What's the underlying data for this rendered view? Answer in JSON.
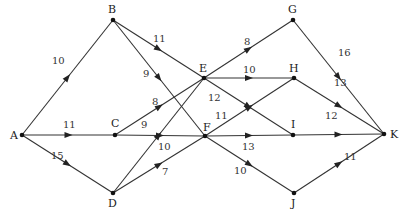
{
  "diagram": {
    "type": "directed-weighted-network",
    "nodes": [
      {
        "id": "A",
        "label": "A",
        "x": 22,
        "y": 135,
        "lx": 10,
        "ly": 139
      },
      {
        "id": "B",
        "label": "B",
        "x": 113,
        "y": 20,
        "lx": 108,
        "ly": 13
      },
      {
        "id": "C",
        "label": "C",
        "x": 115,
        "y": 135,
        "lx": 111,
        "ly": 127
      },
      {
        "id": "D",
        "label": "D",
        "x": 113,
        "y": 193,
        "lx": 108,
        "ly": 207
      },
      {
        "id": "E",
        "label": "E",
        "x": 204,
        "y": 78,
        "lx": 199,
        "ly": 72
      },
      {
        "id": "F",
        "label": "F",
        "x": 205,
        "y": 136,
        "lx": 203,
        "ly": 131
      },
      {
        "id": "G",
        "label": "G",
        "x": 293,
        "y": 20,
        "lx": 288,
        "ly": 13
      },
      {
        "id": "H",
        "label": "H",
        "x": 294,
        "y": 78,
        "lx": 289,
        "ly": 72
      },
      {
        "id": "I",
        "label": "I",
        "x": 293,
        "y": 135,
        "lx": 291,
        "ly": 128
      },
      {
        "id": "J",
        "label": "J",
        "x": 294,
        "y": 193,
        "lx": 291,
        "ly": 207
      },
      {
        "id": "K",
        "label": "K",
        "x": 384,
        "y": 134,
        "lx": 390,
        "ly": 138
      }
    ],
    "edges": [
      {
        "from": "A",
        "to": "B",
        "weight": "10",
        "lx": 52,
        "ly": 64
      },
      {
        "from": "A",
        "to": "C",
        "weight": "11",
        "lx": 63,
        "ly": 128
      },
      {
        "from": "A",
        "to": "D",
        "weight": "15",
        "lx": 51,
        "ly": 159
      },
      {
        "from": "B",
        "to": "E",
        "weight": "11",
        "lx": 153,
        "ly": 42
      },
      {
        "from": "B",
        "to": "F",
        "weight": "9",
        "lx": 143,
        "ly": 77
      },
      {
        "from": "C",
        "to": "E",
        "weight": "8",
        "lx": 152,
        "ly": 105
      },
      {
        "from": "C",
        "to": "F",
        "weight": "9",
        "lx": 141,
        "ly": 128
      },
      {
        "from": "D",
        "to": "E",
        "weight": "10",
        "lx": 158,
        "ly": 150
      },
      {
        "from": "D",
        "to": "F",
        "weight": "7",
        "lx": 162,
        "ly": 175
      },
      {
        "from": "E",
        "to": "G",
        "weight": "8",
        "lx": 244,
        "ly": 45
      },
      {
        "from": "E",
        "to": "H",
        "weight": "10",
        "lx": 243,
        "ly": 73
      },
      {
        "from": "E",
        "to": "I",
        "weight": "12",
        "lx": 208,
        "ly": 101
      },
      {
        "from": "F",
        "to": "H",
        "weight": "11",
        "lx": 215,
        "ly": 119
      },
      {
        "from": "F",
        "to": "I",
        "weight": "13",
        "lx": 242,
        "ly": 150
      },
      {
        "from": "F",
        "to": "J",
        "weight": "10",
        "lx": 234,
        "ly": 174
      },
      {
        "from": "G",
        "to": "K",
        "weight": "16",
        "lx": 338,
        "ly": 56
      },
      {
        "from": "H",
        "to": "K",
        "weight": "13",
        "lx": 334,
        "ly": 86
      },
      {
        "from": "I",
        "to": "K",
        "weight": "12",
        "lx": 325,
        "ly": 119
      },
      {
        "from": "J",
        "to": "K",
        "weight": "11",
        "lx": 344,
        "ly": 160
      }
    ]
  }
}
